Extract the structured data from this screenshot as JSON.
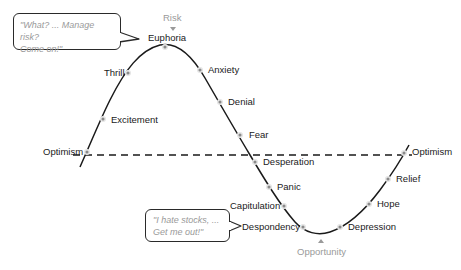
{
  "diagram": {
    "markers": {
      "top": "Risk",
      "bottom": "Opportunity"
    },
    "baseline_label": "Optimism",
    "stages": [
      {
        "label": "Optimism",
        "x": 87,
        "y": 152
      },
      {
        "label": "Excitement",
        "x": 103,
        "y": 119
      },
      {
        "label": "Thrill",
        "x": 128,
        "y": 73
      },
      {
        "label": "Euphoria",
        "x": 165,
        "y": 47
      },
      {
        "label": "Anxiety",
        "x": 200,
        "y": 70
      },
      {
        "label": "Denial",
        "x": 220,
        "y": 102
      },
      {
        "label": "Fear",
        "x": 240,
        "y": 135
      },
      {
        "label": "Desperation",
        "x": 255,
        "y": 162
      },
      {
        "label": "Panic",
        "x": 269,
        "y": 187
      },
      {
        "label": "Capitulation",
        "x": 284,
        "y": 206
      },
      {
        "label": "Despondency",
        "x": 303,
        "y": 227
      },
      {
        "label": "Depression",
        "x": 340,
        "y": 227
      },
      {
        "label": "Hope",
        "x": 369,
        "y": 204
      },
      {
        "label": "Relief",
        "x": 388,
        "y": 179
      },
      {
        "label": "Optimism",
        "x": 404,
        "y": 153
      }
    ],
    "bubbles": {
      "top": {
        "line1": "\"What? ... Manage risk?",
        "line2": "Come on!\""
      },
      "bottom": {
        "line1": "\"I hate stocks, ...",
        "line2": "Get me out!\""
      }
    },
    "colors": {
      "curve": "#1a1a1a",
      "marker": "#9a9a9a",
      "dot": "#7a7a7a"
    }
  }
}
